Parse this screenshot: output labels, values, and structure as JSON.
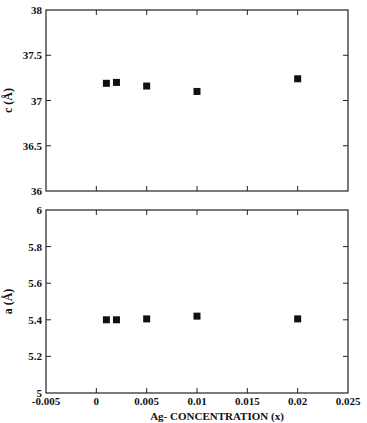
{
  "chart_data": [
    {
      "type": "scatter",
      "title": "",
      "xlabel": "",
      "ylabel": "c (Å)",
      "xlim": [
        -0.005,
        0.025
      ],
      "ylim": [
        36,
        38
      ],
      "yticks": [
        "36",
        "36.5",
        "37",
        "37.5",
        "38"
      ],
      "ytick_values": [
        36,
        36.5,
        37,
        37.5,
        38
      ],
      "xtick_values": [
        -0.005,
        0,
        0.005,
        0.01,
        0.015,
        0.02,
        0.025
      ],
      "grid": false,
      "series": [
        {
          "name": "c",
          "x": [
            0.001,
            0.002,
            0.005,
            0.01,
            0.02
          ],
          "y": [
            37.19,
            37.2,
            37.16,
            37.1,
            37.24
          ]
        }
      ]
    },
    {
      "type": "scatter",
      "title": "",
      "xlabel": "Ag- CONCENTRATION (x)",
      "ylabel": "a (Å)",
      "xlim": [
        -0.005,
        0.025
      ],
      "ylim": [
        5,
        6
      ],
      "xticks": [
        "-0.005",
        "0",
        "0.005",
        "0.01",
        "0.015",
        "0.02",
        "0.025"
      ],
      "xtick_values": [
        -0.005,
        0,
        0.005,
        0.01,
        0.015,
        0.02,
        0.025
      ],
      "yticks": [
        "5",
        "5.2",
        "5.4",
        "5.6",
        "5.8",
        "6"
      ],
      "ytick_values": [
        5,
        5.2,
        5.4,
        5.6,
        5.8,
        6
      ],
      "grid": false,
      "series": [
        {
          "name": "a",
          "x": [
            0.001,
            0.002,
            0.005,
            0.01,
            0.02
          ],
          "y": [
            5.4,
            5.4,
            5.405,
            5.42,
            5.405
          ]
        }
      ]
    }
  ]
}
